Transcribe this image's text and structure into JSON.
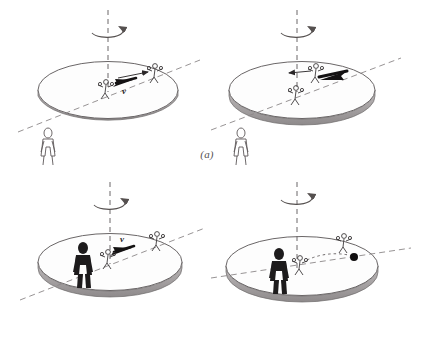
{
  "figure": {
    "type": "physics-illustration",
    "background_color": "#ffffff",
    "ink_color": "#4a4648",
    "dark_fill": "#1d1b1c",
    "panels": [
      {
        "id": "a",
        "caption": "(a)",
        "caption_style": "italic-parenthesized",
        "scenes": [
          {
            "id": "a-left",
            "disk": {
              "label": "rotating turntable",
              "shading": "light-gray-rim"
            },
            "axis": {
              "label": "rotation axis",
              "style": "vertical-dashed"
            },
            "rotation_arrow": {
              "label": "spin direction",
              "style": "elliptical-arrow-around-axis"
            },
            "radial_line": {
              "label": "radial reference line",
              "style": "dashed-diagonal"
            },
            "actors": [
              {
                "name": "skater-inner",
                "position": "near-center",
                "style": "outline-sketch"
              },
              {
                "name": "skater-outer",
                "position": "disk-edge",
                "style": "outline-sketch"
              }
            ],
            "vectors": [
              {
                "name": "velocity-vector",
                "label": "v",
                "direction": "inward-left",
                "style": "solid-black-arrow"
              },
              {
                "name": "thin-guide-arrow",
                "label": "",
                "direction": "outward-right",
                "style": "thin-arrow"
              }
            ],
            "observer": {
              "name": "ground-observer",
              "style": "outline-figure",
              "location": "off-disk-front-left"
            }
          },
          {
            "id": "a-right",
            "disk": {
              "label": "rotating turntable",
              "shading": "light-gray-rim"
            },
            "axis": {
              "label": "rotation axis",
              "style": "vertical-dashed"
            },
            "rotation_arrow": {
              "label": "spin direction",
              "style": "elliptical-arrow-around-axis"
            },
            "radial_line": {
              "label": "radial reference line",
              "style": "dashed-diagonal"
            },
            "actors": [
              {
                "name": "skater-inner",
                "position": "near-center",
                "style": "outline-sketch"
              },
              {
                "name": "skater-outer",
                "position": "mid-disk",
                "style": "outline-sketch"
              }
            ],
            "vectors": [
              {
                "name": "velocity-vector",
                "label": "",
                "direction": "outward-right",
                "style": "solid-black-arrow"
              },
              {
                "name": "thin-guide-arrow",
                "label": "",
                "direction": "inward-left",
                "style": "thin-arrow"
              }
            ],
            "observer": {
              "name": "ground-observer",
              "style": "outline-figure",
              "location": "off-disk-front-left"
            }
          }
        ]
      },
      {
        "id": "b",
        "caption": "(b)",
        "caption_style": "italic-parenthesized",
        "scenes": [
          {
            "id": "b-left",
            "disk": {
              "label": "rotating turntable",
              "shading": "light-gray-rim"
            },
            "axis": {
              "label": "rotation axis",
              "style": "vertical-dashed"
            },
            "rotation_arrow": {
              "label": "spin direction",
              "style": "elliptical-arrow-around-axis"
            },
            "radial_line": {
              "label": "radial reference line",
              "style": "dashed-diagonal"
            },
            "actors": [
              {
                "name": "skater-inner",
                "position": "near-center",
                "style": "outline-sketch"
              },
              {
                "name": "skater-outer",
                "position": "disk-edge",
                "style": "outline-sketch"
              },
              {
                "name": "rider-observer",
                "position": "on-disk-left",
                "style": "solid-silhouette"
              }
            ],
            "vectors": [
              {
                "name": "velocity-vector",
                "label": "v",
                "direction": "inward-left",
                "style": "solid-black-arrow"
              }
            ]
          },
          {
            "id": "b-right",
            "disk": {
              "label": "rotating turntable",
              "shading": "light-gray-rim"
            },
            "axis": {
              "label": "rotation axis",
              "style": "vertical-dashed"
            },
            "rotation_arrow": {
              "label": "spin direction",
              "style": "elliptical-arrow-around-axis"
            },
            "radial_line": {
              "label": "radial reference line",
              "style": "dashed-diagonal"
            },
            "actors": [
              {
                "name": "skater-inner",
                "position": "near-center",
                "style": "outline-sketch"
              },
              {
                "name": "skater-outer",
                "position": "mid-disk",
                "style": "outline-sketch"
              },
              {
                "name": "rider-observer",
                "position": "on-disk-left",
                "style": "solid-silhouette"
              }
            ],
            "markers": [
              {
                "name": "ball-marker",
                "style": "filled-black-circle",
                "position": "disk-right-of-center"
              }
            ],
            "trajectory": {
              "name": "curved-path",
              "style": "dotted-curve"
            }
          }
        ]
      }
    ],
    "labels": {
      "velocity": "v"
    }
  }
}
